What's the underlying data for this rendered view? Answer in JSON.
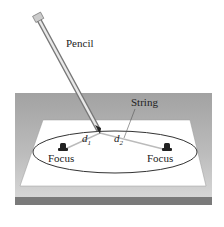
{
  "labels": {
    "pencil": "Pencil",
    "string": "String",
    "d1": "d",
    "d1_sub": "1",
    "d2": "d",
    "d2_sub": "2",
    "focus_left": "Focus",
    "focus_right": "Focus"
  },
  "colors": {
    "table_top": "#a9a9a9",
    "table_front": "#d2d2d2",
    "table_edge": "#7a7a7a",
    "paper": "#ffffff",
    "ink": "#222222"
  }
}
